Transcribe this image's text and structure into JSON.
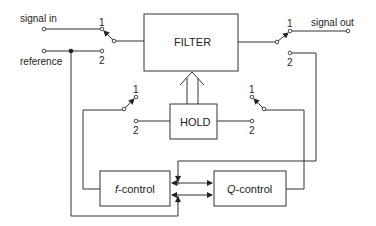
{
  "diagram": {
    "terminals": {
      "signal_in": "signal in",
      "reference": "reference",
      "signal_out": "signal out"
    },
    "blocks": {
      "filter": "FILTER",
      "hold": "HOLD",
      "f_control_prefix": "f",
      "f_control_suffix": "-control",
      "q_control_prefix": "Q",
      "q_control_suffix": "-control"
    },
    "switch_positions": {
      "input_switch": {
        "pos1": "1",
        "pos2": "2"
      },
      "output_switch": {
        "pos1": "1",
        "pos2": "2"
      },
      "hold_left_switch": {
        "pos1": "1",
        "pos2": "2"
      },
      "hold_right_switch": {
        "pos1": "1",
        "pos2": "2"
      }
    },
    "colors": {
      "line": "#333333",
      "background": "#ffffff"
    }
  }
}
